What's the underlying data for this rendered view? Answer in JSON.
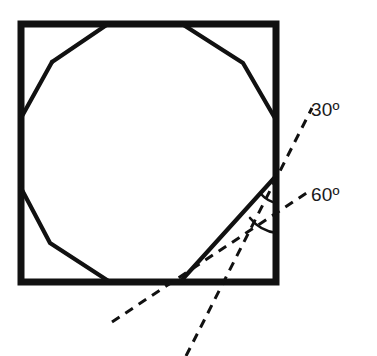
{
  "figure": {
    "background_color": "#ffffff",
    "stroke_color": "#111111",
    "square": {
      "name": "outer-square",
      "left": 21,
      "top": 24,
      "right": 276,
      "bottom": 282,
      "stroke_width": 7
    },
    "polygon": {
      "name": "inscribed-dodecagon",
      "sides": 12,
      "stroke_width": 4.2,
      "points": "108,24 182,24 243,63 276,120 276,176 243,233 180,282 110,282 50,243 21,188 21,118 52,62"
    },
    "solid_chord": {
      "name": "polygon-side-to-right-edge",
      "from": [
        180,
        282
      ],
      "to": [
        276,
        176
      ],
      "stroke_width": 4.2
    },
    "dashed_lines": [
      {
        "name": "construction-line-30",
        "from": [
          186,
          356
        ],
        "to": [
          312,
          108
        ],
        "dash": "9 7",
        "stroke_width": 3
      },
      {
        "name": "construction-line-60",
        "from": [
          112,
          322
        ],
        "to": [
          308,
          192
        ],
        "dash": "9 7",
        "stroke_width": 3
      }
    ],
    "arcs": [
      {
        "name": "angle-arc-30",
        "path": "M 262,196 A 26 26 0 0 0 276,202",
        "stroke_width": 2.6
      },
      {
        "name": "angle-arc-60",
        "path": "M 252,219 A 38 38 0 0 0 276,232",
        "stroke_width": 2.6
      }
    ],
    "vertex": {
      "name": "angle-vertex",
      "x": 276,
      "y": 176
    }
  },
  "labels": {
    "angle_30": {
      "value": "30",
      "degree_symbol": "º",
      "text": "30º"
    },
    "angle_60": {
      "value": "60",
      "degree_symbol": "º",
      "text": "60º"
    }
  },
  "chart_data": {
    "type": "diagram",
    "annotations": [
      "30º",
      "60º"
    ],
    "angles_degrees": [
      30,
      60
    ]
  }
}
